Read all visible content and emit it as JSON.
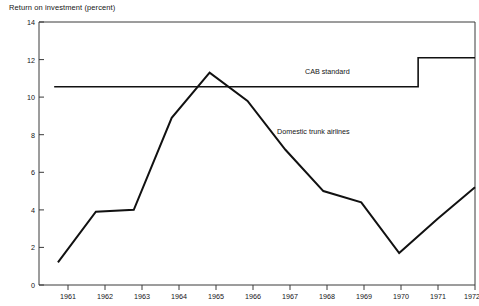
{
  "chart_data": {
    "type": "line",
    "title": "Return on investment (percent)",
    "xlabel": "",
    "ylabel": "Return on investment (percent)",
    "ylim": [
      0,
      14
    ],
    "xlim": [
      1960.5,
      1972.0
    ],
    "yticks": [
      0,
      2,
      4,
      6,
      8,
      10,
      12,
      14
    ],
    "ytick_labels": [
      "0",
      "2",
      "4",
      "6",
      "8",
      "10",
      "12",
      "14"
    ],
    "xticks": [
      1961,
      1962,
      1963,
      1964,
      1965,
      1966,
      1967,
      1968,
      1969,
      1970,
      1971,
      1972
    ],
    "xtick_labels": [
      "1961",
      "1962",
      "1963",
      "1964",
      "1965",
      "1966",
      "1967",
      "1968",
      "1969",
      "1970",
      "1971",
      "1972"
    ],
    "grid": false,
    "legend_position": "inline-annotations",
    "series": [
      {
        "name": "Domestic trunk airlines",
        "label": "Domestic trunk airlines",
        "x": [
          1961,
          1962,
          1963,
          1964,
          1965,
          1966,
          1967,
          1968,
          1969,
          1970,
          1971,
          1972
        ],
        "values": [
          1.2,
          3.9,
          4.0,
          8.9,
          11.3,
          9.8,
          7.2,
          5.0,
          4.4,
          1.7,
          3.5,
          5.2
        ]
      },
      {
        "name": "CAB standard",
        "label": "CAB standard",
        "x": [
          1960.9,
          1970.5,
          1970.5,
          1972.0
        ],
        "values": [
          10.55,
          10.55,
          12.1,
          12.1
        ]
      }
    ],
    "annotations": [
      {
        "text": "CAB standard",
        "x": 1968.3,
        "y": 11.2
      },
      {
        "text": "Domestic trunk airlines",
        "x": 1967.4,
        "y": 7.9
      }
    ]
  }
}
